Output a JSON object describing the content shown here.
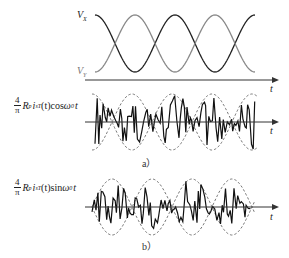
{
  "top_panel": {
    "labels": {
      "vx": "Vx",
      "vx_main": "V",
      "vx_sub": "X",
      "vy_main": "V",
      "vy_sub": "Y",
      "axis": "t"
    },
    "colors": {
      "vx": "#222222",
      "vy": "#888888",
      "axis": "#333333"
    }
  },
  "panel_a": {
    "formula": {
      "coef_num": "4",
      "coef_den": "π",
      "r": "R",
      "r_sub": "p",
      "i": "i",
      "i_sub": "sT",
      "arg": "(t)",
      "trig": "cos",
      "omega": "ω",
      "omega_sub": "0",
      "var": "t"
    },
    "axis_label": "t",
    "caption": "a）"
  },
  "panel_b": {
    "formula": {
      "coef_num": "4",
      "coef_den": "π",
      "r": "R",
      "r_sub": "p",
      "i": "i",
      "i_sub": "sT",
      "arg": "(t)",
      "trig": "sin",
      "omega": "ω",
      "omega_sub": "0",
      "var": "t"
    },
    "axis_label": "t",
    "caption": "b）"
  }
}
